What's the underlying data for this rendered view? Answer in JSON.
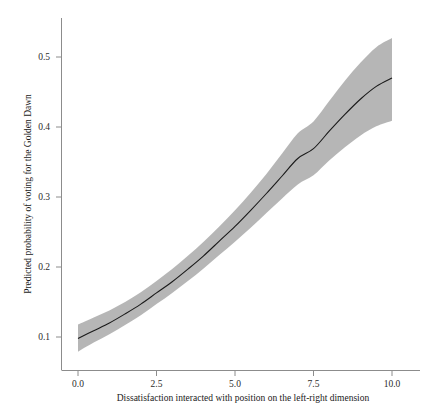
{
  "chart_data": {
    "type": "line",
    "title": "",
    "subtitle": "",
    "xlabel": "Dissatisfaction interacted with position on the left-right dimension",
    "ylabel": "Predicted probability of voting for the Golden Dawn",
    "xlim": [
      -0.35,
      10.35
    ],
    "ylim": [
      0.055,
      0.545
    ],
    "xticks": [
      0.0,
      2.5,
      5.0,
      7.5,
      10.0
    ],
    "xtick_labels": [
      "0.0",
      "2.5",
      "5.0",
      "7.5",
      "10.0"
    ],
    "yticks": [
      0.1,
      0.2,
      0.3,
      0.4,
      0.5
    ],
    "ytick_labels": [
      "0.1",
      "0.2",
      "0.3",
      "0.4",
      "0.5"
    ],
    "grid": false,
    "legend": null,
    "annotations": [],
    "line_color": "#1a1a1a",
    "band_color": "#b2b2b2",
    "axis_color": "#8c8c8c",
    "series": [
      {
        "name": "Predicted probability",
        "x": [
          0.0,
          0.5,
          1.0,
          1.5,
          2.0,
          2.5,
          3.0,
          3.5,
          4.0,
          4.5,
          5.0,
          5.5,
          6.0,
          6.5,
          7.0,
          7.5,
          8.0,
          8.5,
          9.0,
          9.5,
          10.0
        ],
        "values": [
          0.098,
          0.109,
          0.12,
          0.133,
          0.147,
          0.163,
          0.179,
          0.197,
          0.216,
          0.237,
          0.258,
          0.281,
          0.305,
          0.33,
          0.355,
          0.369,
          0.394,
          0.418,
          0.44,
          0.458,
          0.47
        ],
        "ci_lower": [
          0.079,
          0.092,
          0.104,
          0.117,
          0.131,
          0.147,
          0.163,
          0.18,
          0.198,
          0.217,
          0.236,
          0.256,
          0.277,
          0.298,
          0.318,
          0.331,
          0.352,
          0.371,
          0.388,
          0.401,
          0.409
        ],
        "ci_upper": [
          0.118,
          0.128,
          0.138,
          0.15,
          0.164,
          0.18,
          0.197,
          0.216,
          0.236,
          0.258,
          0.281,
          0.306,
          0.333,
          0.362,
          0.391,
          0.408,
          0.437,
          0.466,
          0.492,
          0.514,
          0.527
        ]
      }
    ]
  }
}
